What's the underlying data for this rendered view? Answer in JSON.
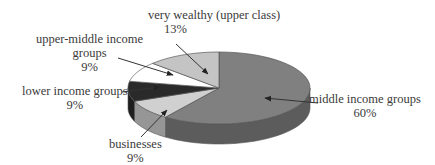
{
  "chart_data": {
    "type": "pie",
    "style": "3d-exploded-none",
    "title": "",
    "slices": [
      {
        "label": "middle income groups",
        "value": 60,
        "percent_label": "60%",
        "color": "#808080"
      },
      {
        "label": "businesses",
        "value": 9,
        "percent_label": "9%",
        "color": "#d0d0d0"
      },
      {
        "label": "lower income groups",
        "value": 9,
        "percent_label": "9%",
        "color": "#2a2a2a"
      },
      {
        "label": "upper-middle income groups",
        "value": 9,
        "percent_label": "9%",
        "color": "#ffffff"
      },
      {
        "label": "very wealthy (upper class)",
        "value": 13,
        "percent_label": "13%",
        "color": "#c4c4c4"
      }
    ],
    "legend": "none (callout labels with arrows)"
  },
  "labels": {
    "very_wealthy": {
      "name": "very wealthy (upper class)",
      "pct": "13%"
    },
    "upper_middle": {
      "line1": "upper-middle income",
      "line2": "groups",
      "pct": "9%"
    },
    "lower": {
      "name": "lower income groups",
      "pct": "9%"
    },
    "businesses": {
      "name": "businesses",
      "pct": "9%"
    },
    "middle": {
      "name": "middle income groups",
      "pct": "60%"
    }
  }
}
